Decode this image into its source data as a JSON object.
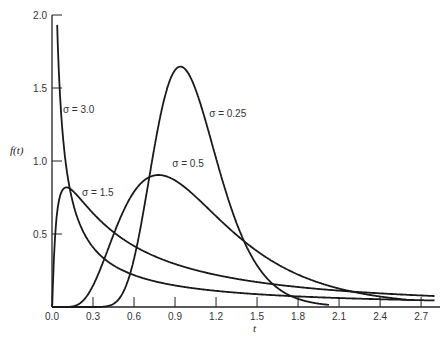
{
  "chart_data": {
    "type": "line",
    "title": "",
    "xlabel": "t",
    "ylabel": "f(t)",
    "xlim": [
      0.0,
      2.8
    ],
    "ylim": [
      0.0,
      2.0
    ],
    "grid": false,
    "legend": "inline labels",
    "x_ticks": [
      "0.0",
      "0.3",
      "0.6",
      "0.9",
      "1.2",
      "1.5",
      "1.8",
      "2.1",
      "2.4",
      "2.7"
    ],
    "x_tick_values": [
      0.0,
      0.3,
      0.6,
      0.9,
      1.2,
      1.5,
      1.8,
      2.1,
      2.4,
      2.7
    ],
    "y_ticks": [
      "0.5",
      "1.0",
      "1.5",
      "2.0"
    ],
    "y_tick_values": [
      0.5,
      1.0,
      1.5,
      2.0
    ],
    "series": [
      {
        "name": "σ = 0.25",
        "sigma": 0.25,
        "t_end": 2.03,
        "label_pos": [
          1.15,
          1.3
        ],
        "x": [
          0.4,
          0.5,
          0.6,
          0.7,
          0.8,
          0.9,
          0.95,
          1.0,
          1.1,
          1.2,
          1.3,
          1.4,
          1.5,
          1.6,
          1.8,
          2.03
        ],
        "values": [
          0.0,
          0.03,
          0.23,
          0.73,
          1.3,
          1.63,
          1.65,
          1.6,
          1.33,
          0.96,
          0.62,
          0.37,
          0.21,
          0.11,
          0.03,
          0.0
        ]
      },
      {
        "name": "σ = 0.5",
        "sigma": 0.5,
        "t_end": 2.62,
        "label_pos": [
          0.88,
          0.96
        ],
        "x": [
          0.15,
          0.25,
          0.4,
          0.6,
          0.78,
          0.9,
          1.0,
          1.2,
          1.5,
          1.8,
          2.1,
          2.4,
          2.62
        ],
        "values": [
          0.0,
          0.11,
          0.42,
          0.77,
          0.9,
          0.89,
          0.8,
          0.6,
          0.36,
          0.21,
          0.12,
          0.07,
          0.05
        ]
      },
      {
        "name": "σ = 1.5",
        "sigma": 1.5,
        "t_end": 2.8,
        "label_pos": [
          0.22,
          0.76
        ],
        "x": [
          0.01,
          0.05,
          0.1,
          0.13,
          0.2,
          0.3,
          0.5,
          0.8,
          1.0,
          1.5,
          2.0,
          2.5,
          2.8
        ],
        "values": [
          0.0,
          0.65,
          0.81,
          0.81,
          0.76,
          0.66,
          0.47,
          0.33,
          0.27,
          0.17,
          0.12,
          0.09,
          0.07
        ]
      },
      {
        "name": "σ = 3.0",
        "sigma": 3.0,
        "t_end": 2.8,
        "label_pos": [
          0.08,
          1.33
        ],
        "x": [
          0.03,
          0.05,
          0.1,
          0.2,
          0.3,
          0.5,
          0.8,
          1.0,
          1.5,
          2.0,
          2.5,
          2.8
        ],
        "values": [
          1.97,
          1.8,
          1.35,
          0.9,
          0.67,
          0.42,
          0.26,
          0.21,
          0.13,
          0.09,
          0.07,
          0.06
        ]
      }
    ]
  }
}
